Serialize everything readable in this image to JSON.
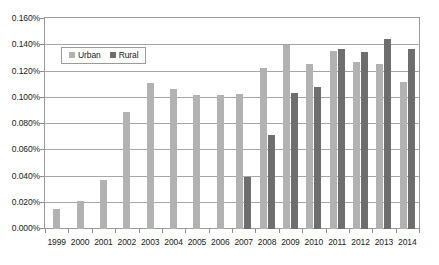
{
  "chart_data": {
    "type": "bar",
    "title": "",
    "xlabel": "",
    "ylabel": "",
    "grid": true,
    "legend_position": "inside-top-left",
    "categories": [
      "1999",
      "2000",
      "2001",
      "2002",
      "2003",
      "2004",
      "2005",
      "2006",
      "2007",
      "2008",
      "2009",
      "2010",
      "2011",
      "2012",
      "2013",
      "2014"
    ],
    "ylim": [
      0,
      0.16
    ],
    "y_tick_values": [
      0.0,
      0.02,
      0.04,
      0.06,
      0.08,
      0.1,
      0.12,
      0.14,
      0.16
    ],
    "y_tick_labels": [
      "0.000%",
      "0.020%",
      "0.040%",
      "0.060%",
      "0.080%",
      "0.100%",
      "0.120%",
      "0.140%",
      "0.160%"
    ],
    "series": [
      {
        "name": "Urban",
        "color": "#b2b2b2",
        "values": [
          0.015,
          0.021,
          0.037,
          0.089,
          0.111,
          0.107,
          0.102,
          0.102,
          0.103,
          0.123,
          0.14,
          0.126,
          0.136,
          0.127,
          0.126,
          0.112
        ]
      },
      {
        "name": "Rural",
        "color": "#6e6e6e",
        "values": [
          null,
          null,
          null,
          null,
          null,
          null,
          null,
          null,
          0.04,
          0.072,
          0.104,
          0.108,
          0.137,
          0.135,
          0.145,
          0.137
        ]
      }
    ]
  },
  "legend": {
    "items": [
      {
        "label": "Urban",
        "swatch": "urban"
      },
      {
        "label": "Rural",
        "swatch": "rural"
      }
    ]
  },
  "colors": {
    "urban": "#b2b2b2",
    "rural": "#6e6e6e",
    "grid": "#a6a6a6",
    "axis": "#8d8d8d",
    "text": "#1a1a1a",
    "background": "#ffffff"
  }
}
